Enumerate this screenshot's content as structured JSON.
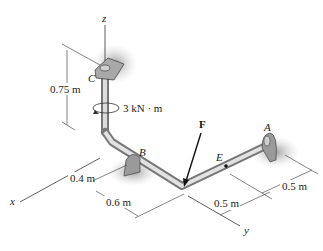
{
  "diagram": {
    "type": "3D statics pipe assembly",
    "axes": {
      "x": "x",
      "y": "y",
      "z": "z"
    },
    "points": {
      "A": "A",
      "B": "B",
      "C": "C",
      "E": "E"
    },
    "force_label": "F",
    "couple_moment": "3 kN · m",
    "dimensions": {
      "vertical_c": "0.75 m",
      "x_offset": "0.4 m",
      "b_to_corner": "0.6 m",
      "a_offset": "0.5 m",
      "e_segment": "0.5 m"
    },
    "colors": {
      "pipe": "#c8c8c8",
      "pipe_shadow": "#8a8a8a",
      "support": "#9a9a9a",
      "ground_shadow": "#b5b5b5",
      "line": "#333333"
    }
  }
}
